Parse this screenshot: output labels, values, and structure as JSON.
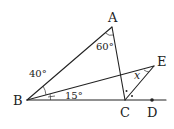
{
  "diagram": {
    "points": {
      "A": {
        "label": "A",
        "x": 112,
        "y": 27
      },
      "B": {
        "label": "B",
        "x": 27,
        "y": 100
      },
      "C": {
        "label": "C",
        "x": 125,
        "y": 100
      },
      "D": {
        "label": "D",
        "x": 152,
        "y": 100
      },
      "E": {
        "label": "E",
        "x": 154,
        "y": 66
      }
    },
    "angles": {
      "angle_A": "60°",
      "angle_ABE_outer": "40°",
      "angle_EBC": "15°",
      "angle_x": "x"
    },
    "colors": {
      "stroke": "#222222",
      "background": "#ffffff"
    }
  }
}
